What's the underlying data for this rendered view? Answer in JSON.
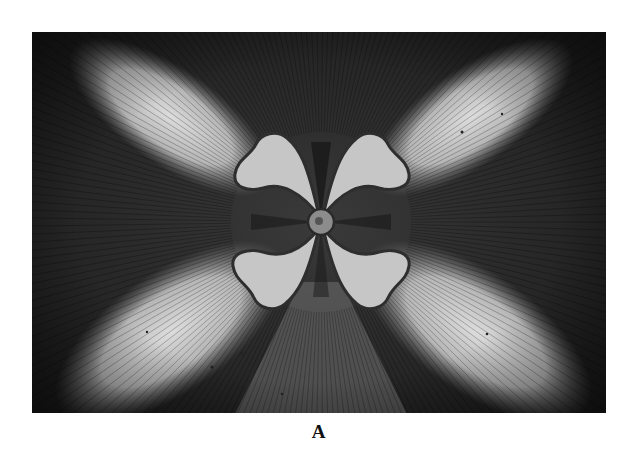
{
  "figure": {
    "caption": "A",
    "colors": {
      "dark": "#1c1c1c",
      "mid": "#6e6e6e",
      "light": "#d9d9d9",
      "lobe": "#c8c8c8",
      "lobe_edge": "#3a3a3a"
    }
  }
}
